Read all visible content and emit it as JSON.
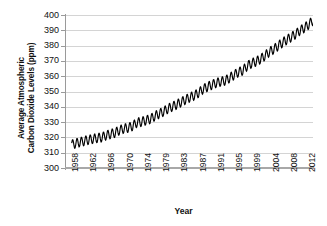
{
  "chart_data": {
    "type": "line",
    "title": "",
    "xlabel": "Year",
    "ylabel_line1": "Average Atmospheric",
    "ylabel_line2": "Carbon Dioxide Levels (ppm)",
    "ylabel": "Average Atmospheric Carbon Dioxide Levels (ppm)",
    "ylim": [
      300,
      400
    ],
    "yticks": [
      400,
      390,
      380,
      370,
      360,
      350,
      340,
      330,
      320,
      310,
      300
    ],
    "xlim": [
      1958,
      2013
    ],
    "xticks": [
      "1958",
      "1962",
      "1966",
      "1970",
      "1974",
      "1979",
      "1983",
      "1987",
      "1991",
      "1995",
      "1999",
      "2004",
      "2008",
      "2012"
    ],
    "grid": "horizontal",
    "legend": "none",
    "series_name": "Mauna Loa monthly mean CO2",
    "series_color": "#000000",
    "gridline_color": "#d4d4d4",
    "axis_color": "#9a9a9a",
    "seasonal_amplitude_ppm": 3.0,
    "annual_mean": [
      {
        "year": 1958,
        "value": 315.3
      },
      {
        "year": 1959,
        "value": 315.98
      },
      {
        "year": 1960,
        "value": 316.91
      },
      {
        "year": 1961,
        "value": 317.64
      },
      {
        "year": 1962,
        "value": 318.45
      },
      {
        "year": 1963,
        "value": 318.99
      },
      {
        "year": 1964,
        "value": 319.62
      },
      {
        "year": 1965,
        "value": 320.04
      },
      {
        "year": 1966,
        "value": 321.37
      },
      {
        "year": 1967,
        "value": 322.18
      },
      {
        "year": 1968,
        "value": 323.05
      },
      {
        "year": 1969,
        "value": 324.62
      },
      {
        "year": 1970,
        "value": 325.68
      },
      {
        "year": 1971,
        "value": 326.32
      },
      {
        "year": 1972,
        "value": 327.46
      },
      {
        "year": 1973,
        "value": 329.68
      },
      {
        "year": 1974,
        "value": 330.19
      },
      {
        "year": 1975,
        "value": 331.12
      },
      {
        "year": 1976,
        "value": 332.03
      },
      {
        "year": 1977,
        "value": 333.84
      },
      {
        "year": 1978,
        "value": 335.4
      },
      {
        "year": 1979,
        "value": 336.84
      },
      {
        "year": 1980,
        "value": 338.75
      },
      {
        "year": 1981,
        "value": 340.11
      },
      {
        "year": 1982,
        "value": 341.45
      },
      {
        "year": 1983,
        "value": 343.05
      },
      {
        "year": 1984,
        "value": 344.65
      },
      {
        "year": 1985,
        "value": 346.12
      },
      {
        "year": 1986,
        "value": 347.42
      },
      {
        "year": 1987,
        "value": 349.19
      },
      {
        "year": 1988,
        "value": 351.57
      },
      {
        "year": 1989,
        "value": 353.12
      },
      {
        "year": 1990,
        "value": 354.39
      },
      {
        "year": 1991,
        "value": 355.61
      },
      {
        "year": 1992,
        "value": 356.45
      },
      {
        "year": 1993,
        "value": 357.1
      },
      {
        "year": 1994,
        "value": 358.83
      },
      {
        "year": 1995,
        "value": 360.82
      },
      {
        "year": 1996,
        "value": 362.61
      },
      {
        "year": 1997,
        "value": 363.73
      },
      {
        "year": 1998,
        "value": 366.7
      },
      {
        "year": 1999,
        "value": 368.38
      },
      {
        "year": 2000,
        "value": 369.55
      },
      {
        "year": 2001,
        "value": 371.14
      },
      {
        "year": 2002,
        "value": 373.28
      },
      {
        "year": 2003,
        "value": 375.8
      },
      {
        "year": 2004,
        "value": 377.52
      },
      {
        "year": 2005,
        "value": 379.8
      },
      {
        "year": 2006,
        "value": 381.9
      },
      {
        "year": 2007,
        "value": 383.79
      },
      {
        "year": 2008,
        "value": 385.6
      },
      {
        "year": 2009,
        "value": 387.43
      },
      {
        "year": 2010,
        "value": 389.9
      },
      {
        "year": 2011,
        "value": 391.65
      },
      {
        "year": 2012,
        "value": 393.85
      },
      {
        "year": 2013,
        "value": 396.52
      }
    ]
  }
}
